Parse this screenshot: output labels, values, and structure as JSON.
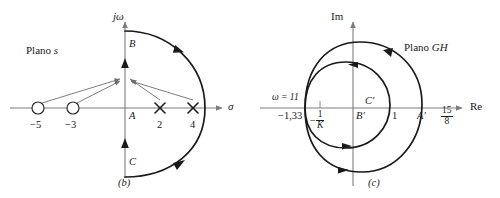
{
  "figure": {
    "panels": [
      {
        "caption": "(b)",
        "plane_label_prefix": "Plano",
        "plane_label_symbol": "s",
        "axis_vertical": "jω",
        "axis_horizontal": "σ",
        "points": [
          {
            "name": "zero-minus-5",
            "label": "−5",
            "type": "zero",
            "value": -5
          },
          {
            "name": "zero-minus-3",
            "label": "−3",
            "type": "zero",
            "value": -3
          },
          {
            "name": "pole-2",
            "label": "2",
            "type": "pole",
            "value": 2
          },
          {
            "name": "pole-4",
            "label": "4",
            "type": "pole",
            "value": 4
          }
        ],
        "contour_labels": [
          {
            "name": "contour-point-a",
            "label": "A"
          },
          {
            "name": "contour-point-b",
            "label": "B"
          },
          {
            "name": "contour-point-c",
            "label": "C"
          }
        ]
      },
      {
        "caption": "(c)",
        "plane_label_prefix": "Plano",
        "plane_label_symbol": "GH",
        "axis_vertical": "Im",
        "axis_horizontal": "Re",
        "omega_label": "ω = 11",
        "crossing_left": "−1,33",
        "crossing_inner_right": "1",
        "crossing_outer_right_num": "15",
        "crossing_outer_right_den": "8",
        "critical_point_sign": "−",
        "critical_point_num": "1",
        "critical_point_den": "K",
        "contour_labels": [
          {
            "name": "image-point-a-prime",
            "label": "A′"
          },
          {
            "name": "image-point-b-prime",
            "label": "B′"
          },
          {
            "name": "image-point-c-prime",
            "label": "C′"
          }
        ]
      }
    ],
    "colors": {
      "axis": "#7d7d7d",
      "contour": "#1a1a1a",
      "vector": "#6e6e6e",
      "text": "#1a1a1a"
    }
  }
}
